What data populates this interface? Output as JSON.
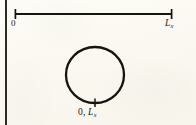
{
  "figure": {
    "kind": "periodic-boundary-diagram",
    "background_color": "#faf9f2",
    "ink_color": "#17140f",
    "page_rule": {
      "name": "left-page-border-rule",
      "orientation": "vertical",
      "x": 6,
      "y_start": 0,
      "y_end": 125,
      "thickness": 1.6
    },
    "segment": {
      "name": "x-axis-segment",
      "y": 14,
      "x_start": 15,
      "x_end": 172,
      "thickness": 1.7,
      "cap_half_height": 5,
      "left_label": "0",
      "right_label": "L",
      "right_label_subscript": "x"
    },
    "circle": {
      "name": "periodic-identification-circle",
      "center_x": 95,
      "center_y": 75,
      "radius_x": 29,
      "radius_y": 28,
      "thickness": 2.2,
      "tick": {
        "name": "circle-bottom-tick",
        "x": 95,
        "y_top": 99,
        "y_bottom": 107,
        "thickness": 1.4
      },
      "label_prefix": "0, ",
      "label": "L",
      "label_subscript": "x"
    }
  }
}
